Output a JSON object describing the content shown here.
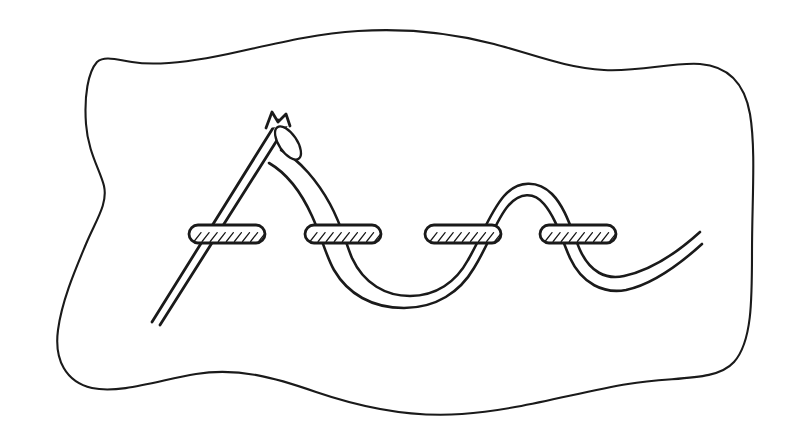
{
  "illustration": {
    "title": "Running stitch on fabric",
    "subject": "needle-and-thread-stitch-diagram",
    "style": "black-line-art-on-white",
    "background_color": "#ffffff",
    "line_color": "#1a1a1a"
  },
  "canvas": {
    "width": 802,
    "height": 446
  },
  "fabric": {
    "name": "fabric-piece",
    "fill_color": "#ffffff",
    "stroke_color": "#1a1a1a",
    "stroke_width": 2.1,
    "outline_path": "M 97 62 C 88 72 84 96 86 124 C 88 152 100 170 104 186 C 108 204 96 220 86 244 C 76 268 62 300 58 330 C 54 360 66 382 92 388 C 120 394 160 380 196 374 C 238 367 276 378 316 392 C 360 407 410 418 462 414 C 520 410 578 392 628 384 C 676 376 716 382 734 362 C 752 342 752 300 752 252 C 752 200 756 150 750 114 C 744 80 726 66 700 64 C 672 62 640 72 604 70 C 566 68 532 54 494 44 C 452 33 404 28 358 31 C 310 34 266 46 228 54 C 190 62 156 66 132 62 C 114 59 104 56 97 62 Z"
  },
  "stitch_bars": {
    "name": "stitch-bars",
    "count": 4,
    "label": "hatched stitch bar",
    "height": 18,
    "width": 76,
    "hatch_count": 9,
    "items": [
      {
        "id": 1,
        "x": 189,
        "y": 225,
        "w": 76,
        "h": 18
      },
      {
        "id": 2,
        "x": 305,
        "y": 225,
        "w": 76,
        "h": 18
      },
      {
        "id": 3,
        "x": 425,
        "y": 225,
        "w": 76,
        "h": 18
      },
      {
        "id": 4,
        "x": 540,
        "y": 225,
        "w": 76,
        "h": 18
      }
    ]
  },
  "thread": {
    "name": "sewing-thread",
    "style": "double-line-outline",
    "stroke_width": 2.6,
    "description": "Thread runs from the needle eye, weaves under and over four stitch bars in a wave, and ends in an open tail at the right.",
    "outer_path": "M 281 150 C 300 160 318 182 330 204 C 342 226 346 244 352 258 C 364 284 386 296 410 296 C 436 296 456 282 468 260 C 482 236 490 212 504 196 C 518 180 538 180 552 194 C 566 208 572 232 580 250 C 590 272 606 280 624 276 C 652 270 678 252 700 232",
    "inner_path": "M 269 163 C 288 174 302 194 312 216 C 322 238 326 256 334 270 C 348 294 372 308 404 308 C 436 308 460 292 474 268 C 490 242 496 220 508 206 C 520 192 534 192 544 204 C 556 218 562 240 570 258 C 582 284 604 294 626 290 C 654 284 680 264 702 244",
    "tail_end": {
      "x": 700,
      "y": 232
    }
  },
  "needle": {
    "name": "sewing-needle",
    "style": "double-line-outline",
    "description": "Straight needle angled from lower-left point to upper-right blunt notched head with an elongated eye.",
    "tip": {
      "x": 152,
      "y": 322
    },
    "head": {
      "x": 276,
      "y": 117
    },
    "shaft_outer": "M 152 322 L 278 120",
    "shaft_inner": "M 160 325 L 286 126",
    "eye": {
      "name": "needle-eye",
      "cx": 288,
      "cy": 143,
      "rx": 9,
      "ry": 19,
      "rotation": -34
    },
    "notch_path": "M 266 128 L 272 112 L 278 122 L 286 114 L 290 126"
  },
  "elements": {
    "fabric_label": "fabric-piece",
    "needle_label": "sewing-needle",
    "thread_label": "sewing-thread",
    "bar_label": "stitch-bar"
  }
}
